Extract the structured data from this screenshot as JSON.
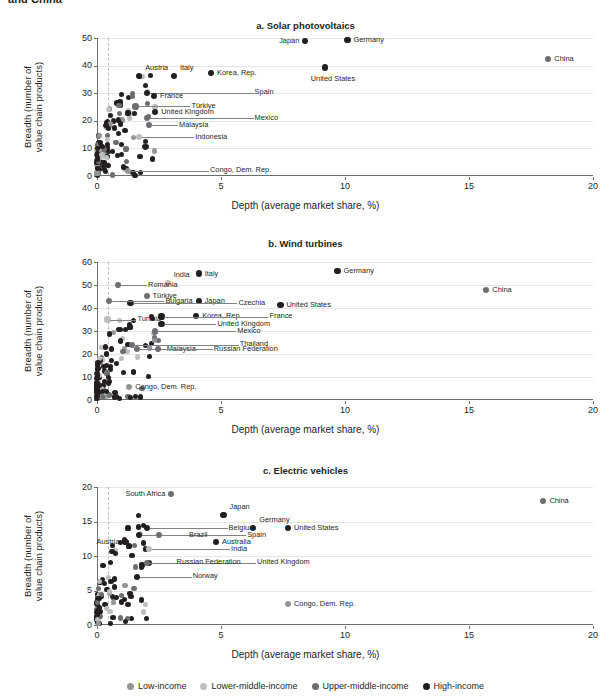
{
  "doc": {
    "title_fragment": "and China"
  },
  "axes": {
    "xlabel": "Depth (average market share, %)",
    "ylabel_line1": "Breadth (number of",
    "ylabel_line2": "value chain products)",
    "xticks": [
      0,
      5,
      10,
      15,
      20
    ],
    "xlim": [
      0,
      20
    ]
  },
  "legend": {
    "position": "bottom",
    "items": [
      {
        "label": "Low-income",
        "color": "#939598"
      },
      {
        "label": "Lower-middle-income",
        "color": "#bcbec0"
      },
      {
        "label": "Upper-middle-income",
        "color": "#6d6e71"
      },
      {
        "label": "High-income",
        "color": "#231f20"
      }
    ]
  },
  "chart_data": [
    {
      "type": "scatter",
      "title": "a. Solar photovoltaics",
      "xlabel": "Depth (average market share, %)",
      "ylabel": "Breadth (number of value chain products)",
      "xlim": [
        0,
        20
      ],
      "ylim": [
        0,
        50
      ],
      "yticks": [
        0,
        10,
        20,
        30,
        40,
        50
      ],
      "grid": "horizontal",
      "labeled_points": [
        {
          "name": "China",
          "x": 18.2,
          "y": 42.3,
          "group": "Upper-middle-income",
          "side": "right"
        },
        {
          "name": "Germany",
          "x": 10.1,
          "y": 49.2,
          "group": "High-income",
          "side": "right"
        },
        {
          "name": "Japan",
          "x": 8.4,
          "y": 48.8,
          "group": "High-income",
          "side": "left"
        },
        {
          "name": "United States",
          "x": 9.2,
          "y": 39.3,
          "group": "High-income",
          "side": "below"
        },
        {
          "name": "Korea, Rep.",
          "x": 4.6,
          "y": 37.2,
          "group": "High-income",
          "side": "right"
        },
        {
          "name": "Italy",
          "x": 3.1,
          "y": 36.1,
          "group": "High-income",
          "side": "above"
        },
        {
          "name": "Austria",
          "x": 1.7,
          "y": 36.1,
          "group": "High-income",
          "side": "above"
        },
        {
          "name": "Spain",
          "x": 2.0,
          "y": 30.1,
          "group": "High-income",
          "side": "leader"
        },
        {
          "name": "France",
          "x": 2.3,
          "y": 29.0,
          "group": "High-income",
          "side": "right"
        },
        {
          "name": "Türkiye",
          "x": 1.55,
          "y": 25.2,
          "group": "Upper-middle-income",
          "side": "leader"
        },
        {
          "name": "United Kingdom",
          "x": 2.35,
          "y": 23.2,
          "group": "High-income",
          "side": "right"
        },
        {
          "name": "Mexico",
          "x": 2.0,
          "y": 20.9,
          "group": "Upper-middle-income",
          "side": "leader"
        },
        {
          "name": "Malaysia",
          "x": 2.1,
          "y": 18.4,
          "group": "Upper-middle-income",
          "side": "leader"
        },
        {
          "name": "Indonesia",
          "x": 1.7,
          "y": 14.0,
          "group": "Lower-middle-income",
          "side": "leader"
        },
        {
          "name": "Congo, Dem. Rep.",
          "x": 1.25,
          "y": 1.9,
          "group": "Low-income",
          "side": "leader"
        }
      ],
      "cluster_note": "Dense unlabeled cluster at x<2.5 spanning y 0-30"
    },
    {
      "type": "scatter",
      "title": "b. Wind turbines",
      "xlabel": "Depth (average market share, %)",
      "ylabel": "Breadth (number of value chain products)",
      "xlim": [
        0,
        20
      ],
      "ylim": [
        0,
        60
      ],
      "yticks": [
        0,
        10,
        20,
        30,
        40,
        50,
        60
      ],
      "grid": "horizontal",
      "labeled_points": [
        {
          "name": "China",
          "x": 15.7,
          "y": 48.0,
          "group": "Upper-middle-income",
          "side": "right"
        },
        {
          "name": "Germany",
          "x": 9.7,
          "y": 56.2,
          "group": "High-income",
          "side": "right"
        },
        {
          "name": "United States",
          "x": 7.4,
          "y": 41.3,
          "group": "High-income",
          "side": "right"
        },
        {
          "name": "Italy",
          "x": 4.1,
          "y": 55.0,
          "group": "High-income",
          "side": "right"
        },
        {
          "name": "Japan",
          "x": 4.1,
          "y": 43.2,
          "group": "High-income",
          "side": "right"
        },
        {
          "name": "Korea, Rep.",
          "x": 4.0,
          "y": 36.5,
          "group": "High-income",
          "side": "right"
        },
        {
          "name": "India",
          "x": 2.85,
          "y": 51.0,
          "group": "Lower-middle-income",
          "side": "above"
        },
        {
          "name": "Czechia",
          "x": 1.35,
          "y": 42.1,
          "group": "High-income",
          "side": "leader"
        },
        {
          "name": "Romania",
          "x": 0.85,
          "y": 50.0,
          "group": "Upper-middle-income",
          "side": "leader"
        },
        {
          "name": "Bulgaria",
          "x": 0.5,
          "y": 43.0,
          "group": "Upper-middle-income",
          "side": "leader"
        },
        {
          "name": "Türkiye",
          "x": 2.0,
          "y": 45.3,
          "group": "Upper-middle-income",
          "side": "right"
        },
        {
          "name": "France",
          "x": 2.6,
          "y": 36.3,
          "group": "High-income",
          "side": "leader"
        },
        {
          "name": "Tunisia",
          "x": 0.42,
          "y": 35.0,
          "group": "Lower-middle-income",
          "side": "leader"
        },
        {
          "name": "United Kingdom",
          "x": 2.6,
          "y": 33.0,
          "group": "High-income",
          "side": "leader"
        },
        {
          "name": "Mexico",
          "x": 2.35,
          "y": 29.8,
          "group": "Upper-middle-income",
          "side": "leader"
        },
        {
          "name": "Thailand",
          "x": 1.4,
          "y": 24.0,
          "group": "Upper-middle-income",
          "side": "leader"
        },
        {
          "name": "Malaysia",
          "x": 1.6,
          "y": 22.0,
          "group": "Upper-middle-income",
          "side": "leader"
        },
        {
          "name": "Russian Federation",
          "x": 2.45,
          "y": 22.0,
          "group": "Upper-middle-income",
          "side": "leader"
        },
        {
          "name": "Congo, Dem. Rep.",
          "x": 1.3,
          "y": 5.8,
          "group": "Low-income",
          "side": "right"
        }
      ],
      "cluster_note": "Dense unlabeled cluster at x<2.5 spanning y 0-35"
    },
    {
      "type": "scatter",
      "title": "c. Electric vehicles",
      "xlabel": "Depth (average market share, %)",
      "ylabel": "Breadth (number of value chain products)",
      "xlim": [
        0,
        20
      ],
      "ylim": [
        0,
        20
      ],
      "yticks": [
        0,
        5,
        10,
        15,
        20
      ],
      "grid": "horizontal",
      "labeled_points": [
        {
          "name": "China",
          "x": 18.0,
          "y": 18.0,
          "group": "Upper-middle-income",
          "side": "right"
        },
        {
          "name": "South Africa",
          "x": 3.0,
          "y": 19.0,
          "group": "Upper-middle-income",
          "side": "left"
        },
        {
          "name": "Japan",
          "x": 5.1,
          "y": 16.0,
          "group": "High-income",
          "side": "above"
        },
        {
          "name": "Germany",
          "x": 6.3,
          "y": 14.0,
          "group": "High-income",
          "side": "above"
        },
        {
          "name": "United States",
          "x": 7.7,
          "y": 14.0,
          "group": "High-income",
          "side": "right"
        },
        {
          "name": "Australia",
          "x": 4.8,
          "y": 12.0,
          "group": "High-income",
          "side": "right"
        },
        {
          "name": "Belgium",
          "x": 2.0,
          "y": 14.0,
          "group": "High-income",
          "side": "leader"
        },
        {
          "name": "Spain",
          "x": 1.7,
          "y": 13.0,
          "group": "High-income",
          "side": "leader"
        },
        {
          "name": "Brazil",
          "x": 2.5,
          "y": 13.0,
          "group": "Upper-middle-income",
          "side": "leader"
        },
        {
          "name": "Austria",
          "x": 1.15,
          "y": 12.0,
          "group": "High-income",
          "side": "left"
        },
        {
          "name": "India",
          "x": 2.1,
          "y": 11.0,
          "group": "Lower-middle-income",
          "side": "leader"
        },
        {
          "name": "United Kingdom",
          "x": 2.1,
          "y": 9.0,
          "group": "High-income",
          "side": "leader"
        },
        {
          "name": "Russian Federation",
          "x": 2.0,
          "y": 9.0,
          "group": "Upper-middle-income",
          "side": "leader"
        },
        {
          "name": "Norway",
          "x": 1.6,
          "y": 7.0,
          "group": "High-income",
          "side": "leader"
        },
        {
          "name": "Congo, Dem. Rep.",
          "x": 7.7,
          "y": 3.0,
          "group": "Low-income",
          "side": "right"
        }
      ],
      "cluster_note": "Dense unlabeled cluster at x<2 spanning y 0-12"
    }
  ]
}
